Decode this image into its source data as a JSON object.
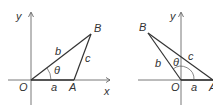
{
  "figures": [
    {
      "name": "acute-triangle",
      "labels": {
        "y_axis": "y",
        "x_axis": "x",
        "origin": "O",
        "point_a": "A",
        "point_b": "B",
        "side_a": "a",
        "side_b": "b",
        "side_c": "c",
        "angle": "θ"
      }
    },
    {
      "name": "obtuse-triangle",
      "labels": {
        "y_axis": "y",
        "x_axis": "x",
        "origin": "O",
        "point_a": "A",
        "point_b": "B",
        "side_a": "a",
        "side_b": "b",
        "side_c": "c",
        "angle": "θ"
      }
    }
  ],
  "colors": {
    "stroke": "#333333",
    "axis": "#555555",
    "background": "#ffffff"
  }
}
